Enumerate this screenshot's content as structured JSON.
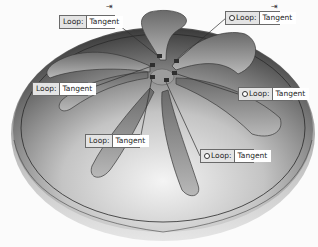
{
  "viewport": {
    "description": "CAD model: domed disc with seven curved spiral slots",
    "colors": {
      "background": "#fbfbfb",
      "dome_dark": "#3a3a3a",
      "dome_mid": "#8a8a8a",
      "dome_light": "#e8e8e8",
      "slot_face": "#9a9a9a",
      "rim_line": "#2a2a2a",
      "leader_line": "#2f2f2f"
    }
  },
  "callouts": [
    {
      "id": 1,
      "label": "Loop:",
      "value": "Tangent",
      "has_dot": false
    },
    {
      "id": 2,
      "label": "Loop:",
      "value": "Tangent",
      "has_dot": true
    },
    {
      "id": 3,
      "label": "Loop:",
      "value": "Tangent",
      "has_dot": false
    },
    {
      "id": 4,
      "label": "Loop:",
      "value": "Tangent",
      "has_dot": true
    },
    {
      "id": 5,
      "label": "Loop:",
      "value": "Tangent",
      "has_dot": false
    },
    {
      "id": 6,
      "label": "Loop:",
      "value": "Tangent",
      "has_dot": true
    }
  ],
  "pins": [
    {
      "glyph": "⇥"
    },
    {
      "glyph": "⇥"
    }
  ]
}
